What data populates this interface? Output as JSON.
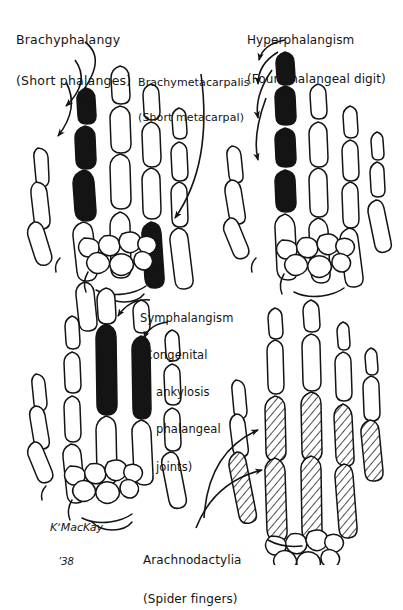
{
  "figure": {
    "type": "medical-illustration",
    "medium": "pen-and-ink line drawing",
    "background_color": "#ffffff",
    "ink_color": "#141414",
    "panel_count": 4,
    "layout": "2x2 grid of skeletal hand radiographic diagrams"
  },
  "signature": {
    "artist": "KʼMacKay",
    "year": "’38"
  },
  "labels": {
    "brachyphalangy": {
      "line1": "Brachyphalangy",
      "line2": "(Short phalanges)",
      "panel": "top-left",
      "arrow_count": 3,
      "marking": "solid-black"
    },
    "brachymetacarpalis": {
      "line1": "Brachymetacarpalis",
      "line2": "(Short metacarpal)",
      "panel": "top-left",
      "arrow_count": 1,
      "marking": "solid-black"
    },
    "hyperphalangism": {
      "line1": "Hyperphalangism",
      "line2": "(Four phalangeal digit)",
      "panel": "top-right",
      "arrow_count": 4,
      "marking": "solid-black"
    },
    "symphalangism": {
      "line1": "Symphalangism",
      "line2": "(Congenital",
      "line3": "ankylosis",
      "line4": "phalangeal",
      "line5": "joints)",
      "panel": "bottom-left",
      "arrow_count": 2,
      "marking": "solid-black"
    },
    "arachnodactylia": {
      "line1": "Arachnodactylia",
      "line2": "(Spider fingers)",
      "panel": "bottom-right",
      "arrow_count": 2,
      "marking": "diagonal-hatching"
    }
  },
  "panels": [
    {
      "id": "panel-top-left",
      "condition": "Brachyphalangy / Brachymetacarpalis",
      "highlighted_bones": "index finger phalanges (3 segments) and ring metacarpal",
      "fill": "black"
    },
    {
      "id": "panel-top-right",
      "condition": "Hyperphalangism",
      "highlighted_bones": "index digit with four phalangeal segments",
      "fill": "black"
    },
    {
      "id": "panel-bottom-left",
      "condition": "Symphalangism",
      "highlighted_bones": "middle and ring digits fused into single columns",
      "fill": "black"
    },
    {
      "id": "panel-bottom-right",
      "condition": "Arachnodactylia",
      "highlighted_bones": "elongated metacarpals and proximal phalanges",
      "fill": "hatched"
    }
  ]
}
